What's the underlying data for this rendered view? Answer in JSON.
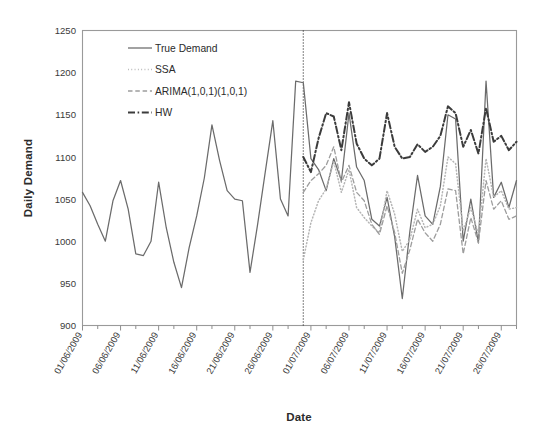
{
  "chart_data": {
    "type": "line",
    "title": "",
    "xlabel": "Date",
    "ylabel": "Daily Demand",
    "ylim": [
      900,
      1250
    ],
    "yticks": [
      900,
      950,
      1000,
      1050,
      1100,
      1150,
      1200,
      1250
    ],
    "grid": false,
    "legend_position": "top-left inside",
    "xtick_labels": [
      "01/06/2009",
      "06/06/2009",
      "11/06/2009",
      "16/06/2009",
      "21/06/2009",
      "26/06/2009",
      "01/07/2009",
      "06/07/2009",
      "11/07/2009",
      "16/07/2009",
      "21/07/2009",
      "26/07/2009"
    ],
    "xtick_indices": [
      0,
      5,
      10,
      15,
      20,
      25,
      30,
      35,
      40,
      45,
      50,
      55
    ],
    "x_count": 58,
    "annotations": [
      {
        "name": "forecast-divider",
        "type": "vertical-dotted-line",
        "x_index": 29,
        "label": "train/forecast split"
      }
    ],
    "series": [
      {
        "name": "True Demand",
        "style": "solid",
        "color": "#6b6b6b",
        "values": [
          1058,
          1042,
          1020,
          1000,
          1048,
          1072,
          1038,
          985,
          983,
          1000,
          1070,
          1016,
          975,
          945,
          992,
          1030,
          1075,
          1138,
          1096,
          1060,
          1050,
          1048,
          963,
          1020,
          1082,
          1143,
          1050,
          1030,
          1190,
          1188,
          1098,
          1085,
          1060,
          1098,
          1072,
          1152,
          1088,
          1072,
          1026,
          1018,
          1052,
          1005,
          932,
          1012,
          1078,
          1030,
          1020,
          1065,
          1150,
          1145,
          1000,
          1050,
          998,
          1190,
          1052,
          1070,
          1040,
          1072
        ]
      },
      {
        "name": "SSA",
        "style": "dotted",
        "color": "#b5b5b5",
        "values": [
          null,
          null,
          null,
          null,
          null,
          null,
          null,
          null,
          null,
          null,
          null,
          null,
          null,
          null,
          null,
          null,
          null,
          null,
          null,
          null,
          null,
          null,
          null,
          null,
          null,
          null,
          null,
          null,
          null,
          978,
          1022,
          1048,
          1062,
          1095,
          1058,
          1085,
          1040,
          1028,
          1018,
          1010,
          1060,
          1032,
          988,
          1002,
          1038,
          1016,
          1020,
          1042,
          1100,
          1092,
          1012,
          1040,
          1008,
          1098,
          1052,
          1060,
          1038,
          1040
        ]
      },
      {
        "name": "ARIMA(1,0,1)(1,0,1)",
        "style": "dashed",
        "color": "#9d9d9d",
        "values": [
          null,
          null,
          null,
          null,
          null,
          null,
          null,
          null,
          null,
          null,
          null,
          null,
          null,
          null,
          null,
          null,
          null,
          null,
          null,
          null,
          null,
          null,
          null,
          null,
          null,
          null,
          null,
          null,
          null,
          1058,
          1072,
          1080,
          1090,
          1112,
          1070,
          1090,
          1058,
          1048,
          1020,
          1008,
          1042,
          1010,
          962,
          990,
          1026,
          1010,
          1000,
          1020,
          1062,
          1060,
          985,
          1028,
          998,
          1072,
          1038,
          1048,
          1026,
          1030
        ]
      },
      {
        "name": "HW",
        "style": "dashdot",
        "color": "#3c3c3c",
        "values": [
          null,
          null,
          null,
          null,
          null,
          null,
          null,
          null,
          null,
          null,
          null,
          null,
          null,
          null,
          null,
          null,
          null,
          null,
          null,
          null,
          null,
          null,
          null,
          null,
          null,
          null,
          null,
          null,
          null,
          1100,
          1082,
          1122,
          1152,
          1148,
          1108,
          1165,
          1116,
          1098,
          1090,
          1098,
          1152,
          1112,
          1098,
          1100,
          1115,
          1106,
          1112,
          1125,
          1160,
          1152,
          1112,
          1132,
          1104,
          1158,
          1118,
          1125,
          1108,
          1118
        ]
      }
    ]
  },
  "legend": {
    "items": [
      {
        "label": "True Demand",
        "style": "solid"
      },
      {
        "label": "SSA",
        "style": "dotted"
      },
      {
        "label": "ARIMA(1,0,1)(1,0,1)",
        "style": "dashed"
      },
      {
        "label": "HW",
        "style": "dashdot"
      }
    ]
  },
  "axes": {
    "y_title": "Daily Demand",
    "x_title": "Date"
  }
}
